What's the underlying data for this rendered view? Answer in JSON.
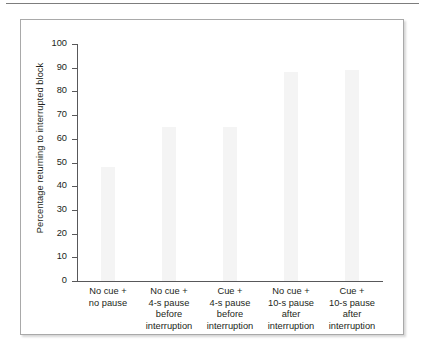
{
  "figure": {
    "frame_border_color": "#a9a9a9",
    "top_rule_color": "#7d7d7d"
  },
  "chart_data": {
    "type": "bar",
    "title": "",
    "subtitle": "",
    "xlabel": "",
    "ylabel": "Percentage returning to interrupted block",
    "ylim": [
      0,
      100
    ],
    "ytick_step": 10,
    "ytick_labels": [
      "0",
      "10",
      "20",
      "30",
      "40",
      "50",
      "60",
      "70",
      "80",
      "90",
      "100"
    ],
    "ytick_values": [
      0,
      10,
      20,
      30,
      40,
      50,
      60,
      70,
      80,
      90,
      100
    ],
    "grid": false,
    "legend": false,
    "legend_position": "none",
    "bar_color": "#f4f4f4",
    "axis_color": "#58585a",
    "categories": [
      "No cue + no pause",
      "No cue + 4-s pause before interruption",
      "Cue + 4-s pause before interruption",
      "No cue + 10-s pause after interruption",
      "Cue + 10-s pause after interruption"
    ],
    "category_lines": [
      [
        "No cue +",
        "no pause"
      ],
      [
        "No cue +",
        "4-s pause",
        "before",
        "interruption"
      ],
      [
        "Cue +",
        "4-s pause",
        "before",
        "interruption"
      ],
      [
        "No cue +",
        "10-s pause",
        "after",
        "interruption"
      ],
      [
        "Cue +",
        "10-s pause",
        "after",
        "interruption"
      ]
    ],
    "values": [
      48,
      65,
      65,
      88,
      89
    ]
  }
}
